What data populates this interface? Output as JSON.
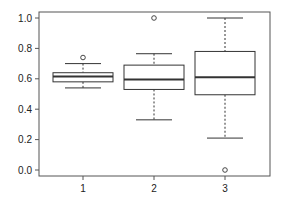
{
  "chart_data": {
    "type": "boxplot",
    "title": "",
    "xlabel": "",
    "ylabel": "",
    "categories": [
      "1",
      "2",
      "3"
    ],
    "ylim": [
      0.0,
      1.0
    ],
    "yticks": [
      "0.0",
      "0.2",
      "0.4",
      "0.6",
      "0.8",
      "1.0"
    ],
    "grid": false,
    "legend": null,
    "boxes": [
      {
        "label": "1",
        "whisker_low": 0.54,
        "q1": 0.58,
        "median": 0.615,
        "q3": 0.64,
        "whisker_high": 0.7,
        "outliers": [
          0.74
        ]
      },
      {
        "label": "2",
        "whisker_low": 0.33,
        "q1": 0.53,
        "median": 0.595,
        "q3": 0.69,
        "whisker_high": 0.765,
        "outliers": [
          1.0
        ]
      },
      {
        "label": "3",
        "whisker_low": 0.21,
        "q1": 0.495,
        "median": 0.61,
        "q3": 0.78,
        "whisker_high": 1.0,
        "outliers": [
          0.0
        ]
      }
    ]
  },
  "colors": {
    "line": "#333333",
    "frame": "#555555",
    "background": "#ffffff"
  }
}
